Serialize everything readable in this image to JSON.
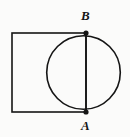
{
  "figure": {
    "background_color": "#fbfbfa",
    "stroke_color": "#151515",
    "labels": {
      "top_point": "B",
      "bottom_point": "A"
    },
    "shapes": {
      "square": {
        "name": "square",
        "x": 12,
        "y": 33,
        "width": 74,
        "height": 79,
        "stroke_width": 1.6,
        "fill": "none"
      },
      "circle": {
        "name": "circle",
        "cx": 83.5,
        "cy": 72.5,
        "r": 36.8,
        "stroke_width": 1.6,
        "fill": "none"
      },
      "chord": {
        "name": "chord-AB",
        "x1": 86,
        "y1": 33,
        "x2": 86,
        "y2": 112,
        "stroke_width": 1.6
      }
    },
    "points": [
      {
        "label": "B",
        "cx": 86,
        "cy": 33,
        "r": 2.6,
        "label_x": 81,
        "label_y": 9
      },
      {
        "label": "A",
        "cx": 86,
        "cy": 112,
        "r": 2.6,
        "label_x": 81,
        "label_y": 119
      }
    ]
  }
}
